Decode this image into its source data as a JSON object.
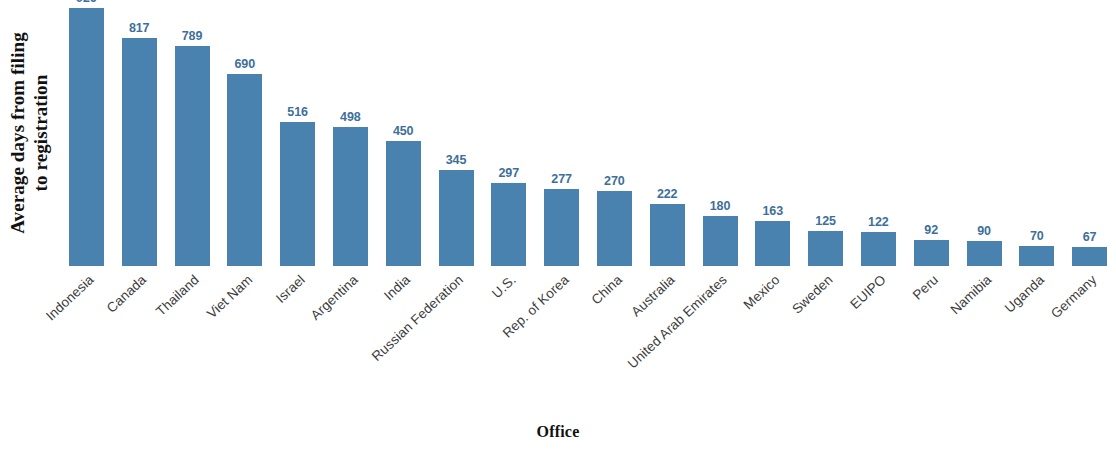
{
  "chart_data": {
    "type": "bar",
    "title": "",
    "subtitle": "",
    "xlabel": "Office",
    "ylabel": "Average days from filing\nto registration",
    "ylim": [
      0,
      926
    ],
    "grid": false,
    "legend": null,
    "legend_position": "none",
    "orientation": "vertical",
    "sorted": "descending",
    "bar_color": "#4a82af",
    "value_label_color": "#3d6f99",
    "categories": [
      "Indonesia",
      "Canada",
      "Thailand",
      "Viet Nam",
      "Israel",
      "Argentina",
      "India",
      "Russian Federation",
      "U.S.",
      "Rep. of Korea",
      "China",
      "Australia",
      "United Arab Emirates",
      "Mexico",
      "Sweden",
      "EUIPO",
      "Peru",
      "Namibia",
      "Uganda",
      "Germany"
    ],
    "values": [
      926,
      817,
      789,
      690,
      516,
      498,
      450,
      345,
      297,
      277,
      270,
      222,
      180,
      163,
      125,
      122,
      92,
      90,
      70,
      67
    ],
    "value_labels": [
      "926",
      "817",
      "789",
      "690",
      "516",
      "498",
      "450",
      "345",
      "297",
      "277",
      "270",
      "222",
      "180",
      "163",
      "125",
      "122",
      "92",
      "90",
      "70",
      "67"
    ]
  }
}
